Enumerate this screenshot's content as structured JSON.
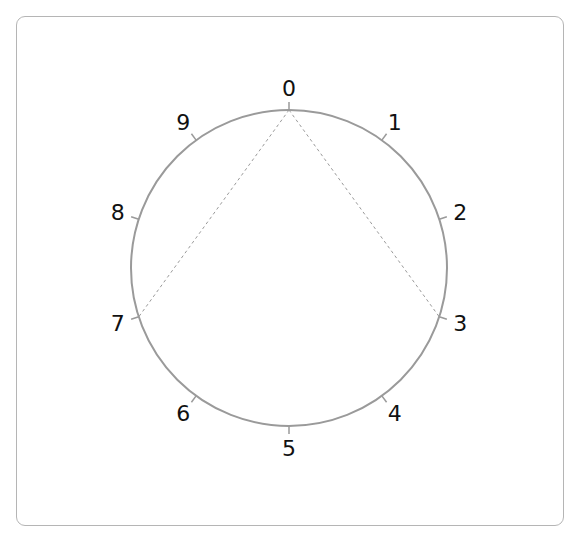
{
  "diagram": {
    "type": "clock-circle",
    "center": [
      289,
      268
    ],
    "radius": 158,
    "label_radius": 180,
    "tick_length": 8,
    "circle_color": "#9a9a9a",
    "chord_color": "#9a9a9a",
    "points": [
      {
        "label": "0",
        "angle": 0
      },
      {
        "label": "1",
        "angle": 36
      },
      {
        "label": "2",
        "angle": 72
      },
      {
        "label": "3",
        "angle": 108
      },
      {
        "label": "4",
        "angle": 144
      },
      {
        "label": "5",
        "angle": 180
      },
      {
        "label": "6",
        "angle": 216
      },
      {
        "label": "7",
        "angle": 252
      },
      {
        "label": "8",
        "angle": 288
      },
      {
        "label": "9",
        "angle": 324
      }
    ],
    "dashed_chords": [
      {
        "from": "0",
        "to": "3"
      },
      {
        "from": "0",
        "to": "7"
      }
    ]
  }
}
